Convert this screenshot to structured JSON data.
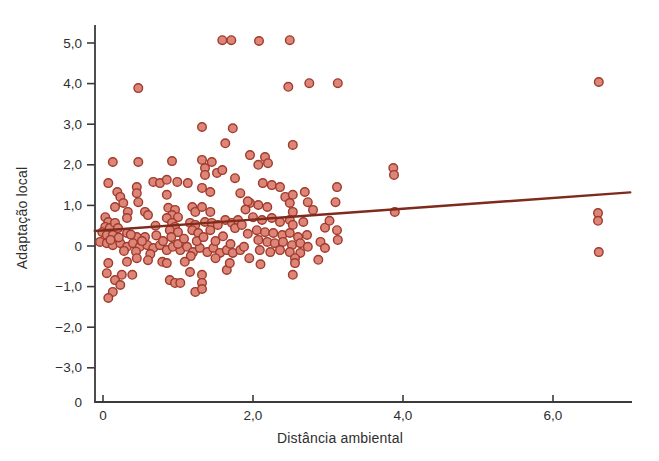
{
  "figure": {
    "background": "#ffffff"
  },
  "chart_data": {
    "type": "scatter",
    "title": "",
    "xlabel": "Distância ambiental",
    "ylabel": "Adaptação local",
    "grid": false,
    "legend": "none",
    "xlim": [
      -0.11,
      7.05
    ],
    "ylim": [
      -3.84,
      5.44
    ],
    "x_ticks": [
      {
        "v": 0,
        "label": "0"
      },
      {
        "v": 2,
        "label": "2,0"
      },
      {
        "v": 4,
        "label": "4,0"
      },
      {
        "v": 6,
        "label": "6,0"
      }
    ],
    "y_ticks": [
      {
        "v": 5,
        "label": "5,0"
      },
      {
        "v": 4,
        "label": "4,0"
      },
      {
        "v": 3,
        "label": "3,0"
      },
      {
        "v": 2,
        "label": "2,0"
      },
      {
        "v": 1,
        "label": "1,0"
      },
      {
        "v": 0,
        "label": "0"
      },
      {
        "v": -1,
        "label": "−1,0"
      },
      {
        "v": -2,
        "label": "−2,0"
      },
      {
        "v": -3,
        "label": "−3,0"
      }
    ],
    "y_corner_label": "0",
    "trend_line": {
      "x1": -0.11,
      "y1": 0.37,
      "x2": 7.03,
      "y2": 1.32
    },
    "colors": {
      "point_fill": "#DC8578",
      "point_stroke": "#A03A2A",
      "trend": "#7E2A1C",
      "axis": "#3a3a3a",
      "text": "#2e2e2e"
    },
    "points": [
      [
        1.59,
        5.07
      ],
      [
        1.71,
        5.07
      ],
      [
        2.08,
        5.05
      ],
      [
        2.49,
        5.07
      ],
      [
        0.47,
        3.89
      ],
      [
        2.47,
        3.92
      ],
      [
        2.75,
        4.01
      ],
      [
        3.13,
        4.01
      ],
      [
        6.61,
        4.04
      ],
      [
        1.32,
        2.93
      ],
      [
        1.73,
        2.9
      ],
      [
        2.53,
        2.49
      ],
      [
        1.63,
        2.53
      ],
      [
        0.13,
        2.07
      ],
      [
        0.47,
        2.07
      ],
      [
        0.92,
        2.09
      ],
      [
        1.32,
        2.12
      ],
      [
        1.36,
        1.92
      ],
      [
        1.45,
        2.07
      ],
      [
        1.96,
        2.24
      ],
      [
        2.16,
        2.19
      ],
      [
        2.07,
        2.0
      ],
      [
        2.2,
        2.04
      ],
      [
        0.07,
        1.55
      ],
      [
        0.19,
        1.33
      ],
      [
        0.23,
        1.21
      ],
      [
        0.45,
        1.45
      ],
      [
        0.45,
        1.3
      ],
      [
        0.47,
        1.08
      ],
      [
        0.67,
        1.58
      ],
      [
        0.76,
        1.55
      ],
      [
        0.85,
        1.63
      ],
      [
        0.99,
        1.58
      ],
      [
        0.85,
        1.26
      ],
      [
        1.13,
        1.55
      ],
      [
        1.36,
        1.75
      ],
      [
        1.32,
        1.43
      ],
      [
        1.43,
        1.33
      ],
      [
        1.52,
        1.8
      ],
      [
        1.59,
        1.87
      ],
      [
        1.76,
        1.67
      ],
      [
        1.83,
        1.3
      ],
      [
        2.13,
        1.55
      ],
      [
        2.25,
        1.5
      ],
      [
        2.36,
        1.45
      ],
      [
        2.43,
        1.21
      ],
      [
        2.53,
        1.26
      ],
      [
        2.69,
        1.33
      ],
      [
        2.73,
        1.08
      ],
      [
        3.12,
        1.45
      ],
      [
        3.1,
        1.08
      ],
      [
        3.87,
        1.92
      ],
      [
        3.88,
        1.75
      ],
      [
        0.16,
        0.96
      ],
      [
        0.27,
        1.06
      ],
      [
        0.33,
        0.84
      ],
      [
        0.56,
        0.84
      ],
      [
        0.6,
        0.76
      ],
      [
        0.87,
        0.94
      ],
      [
        0.96,
        0.89
      ],
      [
        0.92,
        0.76
      ],
      [
        1.0,
        0.71
      ],
      [
        1.19,
        0.96
      ],
      [
        1.23,
        0.84
      ],
      [
        1.32,
        0.96
      ],
      [
        1.43,
        0.84
      ],
      [
        1.96,
        1.06
      ],
      [
        2.07,
        1.01
      ],
      [
        2.19,
        0.96
      ],
      [
        2.49,
        1.06
      ],
      [
        2.53,
        0.84
      ],
      [
        2.8,
        0.89
      ],
      [
        3.89,
        0.84
      ],
      [
        1.9,
        0.9
      ],
      [
        1.93,
        1.1
      ],
      [
        6.6,
        0.81
      ],
      [
        6.6,
        0.62
      ],
      [
        0.03,
        0.71
      ],
      [
        0.07,
        0.59
      ],
      [
        0.03,
        0.47
      ],
      [
        0.09,
        0.44
      ],
      [
        0.16,
        0.57
      ],
      [
        0.2,
        0.44
      ],
      [
        -0.01,
        0.34
      ],
      [
        0.05,
        0.27
      ],
      [
        0.13,
        0.27
      ],
      [
        0.32,
        0.69
      ],
      [
        0.32,
        0.32
      ],
      [
        0.45,
        0.22
      ],
      [
        0.56,
        0.22
      ],
      [
        0.85,
        0.69
      ],
      [
        0.92,
        0.57
      ],
      [
        0.96,
        0.47
      ],
      [
        0.89,
        0.39
      ],
      [
        1.0,
        0.34
      ],
      [
        1.16,
        0.57
      ],
      [
        1.23,
        0.52
      ],
      [
        1.19,
        0.39
      ],
      [
        1.27,
        0.32
      ],
      [
        1.36,
        0.59
      ],
      [
        1.45,
        0.57
      ],
      [
        1.43,
        0.39
      ],
      [
        1.53,
        0.52
      ],
      [
        1.63,
        0.64
      ],
      [
        1.72,
        0.57
      ],
      [
        1.76,
        0.44
      ],
      [
        1.8,
        0.64
      ],
      [
        1.85,
        0.52
      ],
      [
        0.7,
        0.5
      ],
      [
        2.0,
        0.71
      ],
      [
        2.12,
        0.64
      ],
      [
        2.25,
        0.69
      ],
      [
        2.36,
        0.59
      ],
      [
        2.49,
        0.64
      ],
      [
        2.53,
        0.52
      ],
      [
        2.67,
        0.59
      ],
      [
        2.05,
        0.39
      ],
      [
        2.16,
        0.34
      ],
      [
        2.27,
        0.32
      ],
      [
        2.39,
        0.27
      ],
      [
        2.49,
        0.32
      ],
      [
        2.6,
        0.22
      ],
      [
        2.72,
        0.27
      ],
      [
        3.12,
        0.39
      ],
      [
        2.96,
        0.45
      ],
      [
        3.02,
        0.62
      ],
      [
        1.93,
        0.3
      ],
      [
        -0.04,
        0.1
      ],
      [
        0.05,
        0.07
      ],
      [
        0.13,
        0.02
      ],
      [
        0.23,
        0.07
      ],
      [
        0.32,
        -0.02
      ],
      [
        0.4,
        0.07
      ],
      [
        0.49,
        -0.02
      ],
      [
        0.59,
        0.02
      ],
      [
        0.67,
        -0.05
      ],
      [
        0.76,
        0.02
      ],
      [
        0.85,
        -0.1
      ],
      [
        0.93,
        -0.02
      ],
      [
        1.03,
        -0.1
      ],
      [
        1.12,
        -0.02
      ],
      [
        1.2,
        -0.15
      ],
      [
        1.29,
        -0.05
      ],
      [
        1.39,
        -0.15
      ],
      [
        1.47,
        -0.05
      ],
      [
        1.56,
        -0.17
      ],
      [
        1.65,
        -0.1
      ],
      [
        1.73,
        -0.17
      ],
      [
        1.83,
        -0.1
      ],
      [
        2.07,
        0.15
      ],
      [
        2.19,
        0.1
      ],
      [
        2.29,
        0.07
      ],
      [
        2.4,
        0.1
      ],
      [
        2.52,
        0.02
      ],
      [
        2.63,
        0.07
      ],
      [
        2.73,
        -0.02
      ],
      [
        3.13,
        0.15
      ],
      [
        2.09,
        -0.1
      ],
      [
        2.23,
        -0.15
      ],
      [
        2.36,
        -0.1
      ],
      [
        2.49,
        -0.15
      ],
      [
        2.63,
        -0.17
      ],
      [
        2.56,
        -0.3
      ],
      [
        0.1,
        0.15
      ],
      [
        0.21,
        0.21
      ],
      [
        0.28,
        -0.12
      ],
      [
        0.37,
        0.28
      ],
      [
        0.44,
        -0.14
      ],
      [
        0.52,
        0.12
      ],
      [
        0.63,
        -0.2
      ],
      [
        0.71,
        0.26
      ],
      [
        0.8,
        0.12
      ],
      [
        0.91,
        0.22
      ],
      [
        1.0,
        0.05
      ],
      [
        1.08,
        0.18
      ],
      [
        1.17,
        -0.25
      ],
      [
        1.25,
        0.12
      ],
      [
        1.34,
        0.22
      ],
      [
        1.5,
        0.12
      ],
      [
        1.6,
        0.24
      ],
      [
        1.7,
        0.05
      ],
      [
        1.88,
        -0.02
      ],
      [
        2.9,
        0.1
      ],
      [
        2.96,
        -0.05
      ],
      [
        6.61,
        -0.15
      ],
      [
        0.07,
        -0.42
      ],
      [
        0.32,
        -0.39
      ],
      [
        0.05,
        -0.67
      ],
      [
        0.16,
        -0.84
      ],
      [
        0.23,
        -0.96
      ],
      [
        0.13,
        -1.13
      ],
      [
        0.07,
        -1.28
      ],
      [
        0.39,
        -0.71
      ],
      [
        0.25,
        -0.71
      ],
      [
        0.79,
        -0.39
      ],
      [
        0.85,
        -0.42
      ],
      [
        1.09,
        -0.39
      ],
      [
        0.89,
        -0.84
      ],
      [
        0.96,
        -0.91
      ],
      [
        1.03,
        -0.91
      ],
      [
        1.16,
        -0.64
      ],
      [
        1.32,
        -0.71
      ],
      [
        1.32,
        -0.91
      ],
      [
        1.23,
        -1.13
      ],
      [
        1.32,
        -1.06
      ],
      [
        1.65,
        -0.59
      ],
      [
        1.69,
        -0.42
      ],
      [
        2.56,
        -0.42
      ],
      [
        2.53,
        -0.71
      ],
      [
        2.87,
        -0.34
      ],
      [
        0.45,
        -0.3
      ],
      [
        0.6,
        -0.35
      ],
      [
        1.5,
        -0.3
      ],
      [
        1.95,
        -0.3
      ],
      [
        2.1,
        -0.45
      ]
    ]
  }
}
